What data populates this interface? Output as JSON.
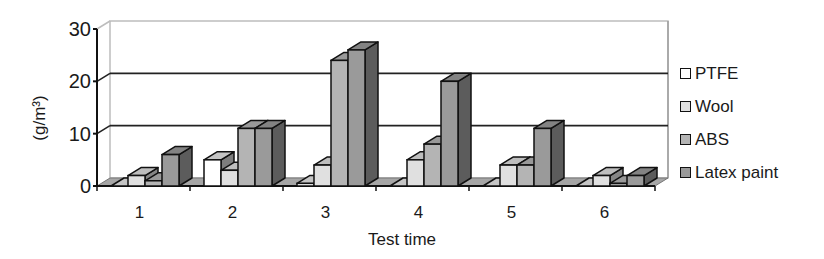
{
  "chart_data": {
    "type": "bar",
    "style": "3d-clustered-column",
    "title": "",
    "xlabel": "Test time",
    "ylabel": "(g/m³)",
    "ylim": [
      0,
      30
    ],
    "yticks": [
      0,
      10,
      20,
      30
    ],
    "categories": [
      "1",
      "2",
      "3",
      "4",
      "5",
      "6"
    ],
    "series": [
      {
        "name": "PTFE",
        "color": "#ffffff",
        "values": [
          0,
          5,
          0.5,
          0,
          0,
          0
        ]
      },
      {
        "name": "Wool",
        "color": "#e0e0e0",
        "values": [
          2,
          3,
          4,
          5,
          4,
          2
        ]
      },
      {
        "name": "ABS",
        "color": "#b4b4b4",
        "values": [
          1,
          11,
          24,
          8,
          4,
          0.5
        ]
      },
      {
        "name": "Latex paint",
        "color": "#9a9a9a",
        "values": [
          6,
          11,
          26,
          20,
          11,
          2
        ]
      }
    ],
    "grid": {
      "horizontal": true,
      "lines_at": [
        10,
        20
      ]
    },
    "legend_position": "right"
  },
  "legend": {
    "items": [
      {
        "label": "PTFE",
        "color": "#ffffff"
      },
      {
        "label": "Wool",
        "color": "#e0e0e0"
      },
      {
        "label": "ABS",
        "color": "#b4b4b4"
      },
      {
        "label": "Latex paint",
        "color": "#9a9a9a"
      }
    ]
  },
  "axes": {
    "xlabel": "Test time",
    "ylabel": "(g/m³)"
  }
}
